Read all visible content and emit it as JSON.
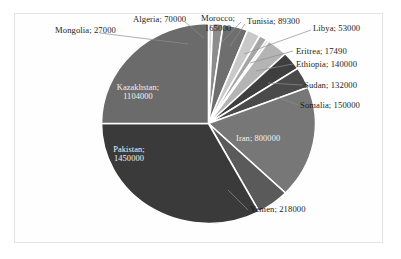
{
  "chart_data": {
    "type": "pie",
    "title": "",
    "subtitle": "",
    "units": "",
    "total": 4415790,
    "legend_position": "none",
    "label_format": "name; value",
    "grid": false,
    "categories": [
      "Mongolia",
      "Algeria",
      "Morocco",
      "Tunisia",
      "Libya",
      "Eritrea",
      "Ethiopia",
      "Sudan",
      "Somalia",
      "Iran",
      "Yemen",
      "Pakistan",
      "Kazakhstan"
    ],
    "values": [
      27000,
      70000,
      165000,
      89300,
      53000,
      17490,
      140000,
      132000,
      150000,
      800000,
      218000,
      1450000,
      1104000
    ],
    "slices": [
      {
        "name": "Mongolia",
        "value": 27000,
        "label": "Mongolia; 27000",
        "color": "#d9d9d9",
        "label_placement": "outside"
      },
      {
        "name": "Algeria",
        "value": 70000,
        "label": "Algeria; 70000",
        "color": "#8c8c8c",
        "label_placement": "outside"
      },
      {
        "name": "Morocco",
        "value": 165000,
        "label": "Morocco; 165000",
        "color": "#6e6e6e",
        "label_placement": "outside"
      },
      {
        "name": "Tunisia",
        "value": 89300,
        "label": "Tunisia; 89300",
        "color": "#c9c9c9",
        "label_placement": "outside"
      },
      {
        "name": "Libya",
        "value": 53000,
        "label": "Libya; 53000",
        "color": "#a6a6a6",
        "label_placement": "outside"
      },
      {
        "name": "Eritrea",
        "value": 17490,
        "label": "Eritrea; 17490",
        "color": "#d2d2d2",
        "label_placement": "outside"
      },
      {
        "name": "Ethiopia",
        "value": 140000,
        "label": "Ethiopia; 140000",
        "color": "#b4b4b4",
        "label_placement": "outside"
      },
      {
        "name": "Sudan",
        "value": 132000,
        "label": "Sudan; 132000",
        "color": "#3f3f3f",
        "label_placement": "outside"
      },
      {
        "name": "Somalia",
        "value": 150000,
        "label": "Somalia; 150000",
        "color": "#4a4a4a",
        "label_placement": "outside"
      },
      {
        "name": "Iran",
        "value": 800000,
        "label": "Iran; 800000",
        "color": "#777777",
        "label_placement": "inside"
      },
      {
        "name": "Yemen",
        "value": 218000,
        "label": "Yemen; 218000",
        "color": "#5a5a5a",
        "label_placement": "outside"
      },
      {
        "name": "Pakistan",
        "value": 1450000,
        "label": "Pakistan; 1450000",
        "color": "#3a3a3a",
        "label_placement": "inside"
      },
      {
        "name": "Kazakhstan",
        "value": 1104000,
        "label": "Kazakhstan; 1104000",
        "color": "#6b6b6b",
        "label_placement": "inside"
      }
    ]
  },
  "labels": {
    "mongolia": "Mongolia; 27000",
    "algeria": "Algeria; 70000",
    "morocco_line1": "Morocco;",
    "morocco_line2": "165000",
    "tunisia": "Tunisia; 89300",
    "libya": "Libya; 53000",
    "eritrea": "Eritrea; 17490",
    "ethiopia": "Ethiopia; 140000",
    "sudan": "Sudan; 132000",
    "somalia": "Somalia; 150000",
    "iran": "Iran; 800000",
    "yemen": "Yemen; 218000",
    "pakistan_line1": "Pakistan;",
    "pakistan_line2": "1450000",
    "kazakhstan_line1": "Kazakhstan;",
    "kazakhstan_line2": "1104000"
  },
  "colors": {
    "background": "#ffffff",
    "frame": "#e3e3e3",
    "leader": "#8d8d8d",
    "slice_outline": "#ffffff",
    "label_text": "#1d1d1d",
    "inside_label_text": "#f2f2f2"
  }
}
